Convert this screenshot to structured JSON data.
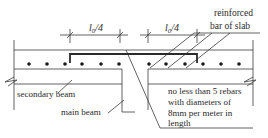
{
  "diagram": {
    "dimension_labels": {
      "left": "l",
      "left_sub": "0",
      "left_rest": "/4",
      "right": "l",
      "right_sub": "0",
      "right_rest": "/4"
    },
    "labels": {
      "reinforced_line1": "reinforced",
      "reinforced_line2": "bar of slab",
      "secondary_beam": "secondary beam",
      "main_beam": "main beam",
      "note_line1": "no less than 5 rebars",
      "note_line2": "with diameters of",
      "note_line3": "8mm per meter in",
      "note_line4": "length"
    },
    "colors": {
      "line": "#3a3a3a",
      "text": "#2a2a2a",
      "background": "#ffffff"
    }
  }
}
